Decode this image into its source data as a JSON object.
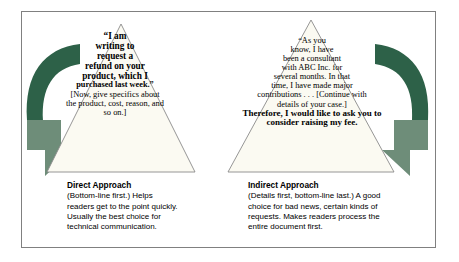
{
  "figure": {
    "colors": {
      "arrow_dark": "#2d6148",
      "arrow_light": "#6e8d79",
      "triangle_fill": "#fbfaf2",
      "triangle_stroke": "#8a8a8a",
      "frame_stroke": "#808080",
      "text": "#000000",
      "background": "#ffffff"
    }
  },
  "left_panel": {
    "triangle": {
      "quote_lines": [
        "“I am",
        "writing to",
        "request a",
        "refund on your",
        "product, which I",
        "purchased last week.”"
      ],
      "detail_lines": [
        "[Now, give specifics about",
        "the product, cost, reason, and",
        "so on.]"
      ]
    },
    "caption": {
      "title": "Direct Approach",
      "lines": [
        "(Bottom-line first.) Helps",
        "readers get to the point quickly.",
        "Usually the best choice for",
        "technical communication."
      ]
    },
    "arrow_name": "curved-down-arrow-left"
  },
  "right_panel": {
    "triangle": {
      "detail_lines": [
        "“As you",
        "know, I have",
        "been a consultant",
        "with ABC Inc. for",
        "several months. In that",
        "time, I have made major",
        "contributions . . . [Continue with",
        "details of your case.]"
      ],
      "conclusion_lines": [
        "Therefore, I would like to ask you to",
        "consider raising my fee."
      ]
    },
    "caption": {
      "title": "Indirect Approach",
      "lines": [
        "(Details first, bottom-line last.) A good",
        "choice for bad news, certain kinds of",
        "requests. Makes readers process the",
        "entire document first."
      ]
    },
    "arrow_name": "curved-down-arrow-right"
  }
}
